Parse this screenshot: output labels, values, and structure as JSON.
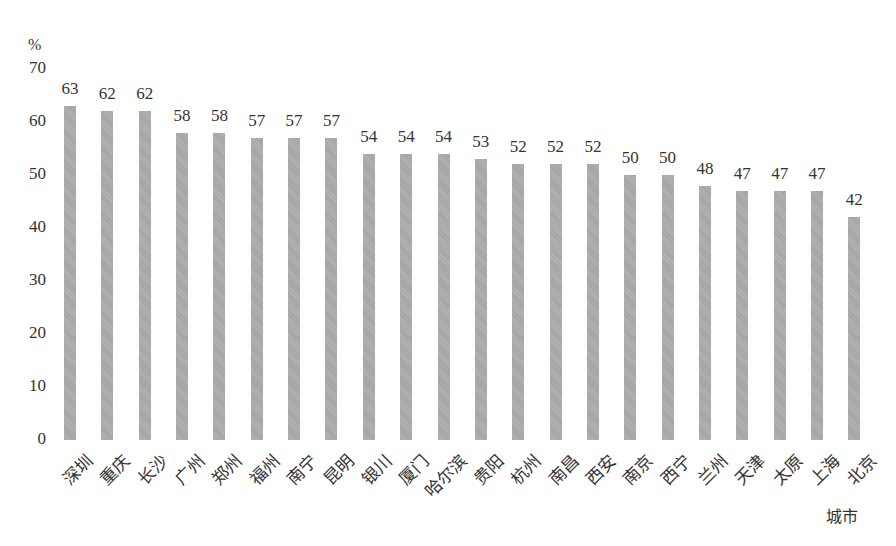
{
  "chart_data": {
    "type": "bar",
    "title": "",
    "xlabel": "城市",
    "ylabel": "%",
    "ylim": [
      0,
      70
    ],
    "yticks": [
      0,
      10,
      20,
      30,
      40,
      50,
      60,
      70
    ],
    "grid": false,
    "legend": null,
    "categories": [
      "深圳",
      "重庆",
      "长沙",
      "广州",
      "郑州",
      "福州",
      "南宁",
      "昆明",
      "银川",
      "厦门",
      "哈尔滨",
      "贵阳",
      "杭州",
      "南昌",
      "西安",
      "南京",
      "西宁",
      "兰州",
      "天津",
      "太原",
      "上海",
      "北京"
    ],
    "values": [
      63,
      62,
      62,
      58,
      58,
      57,
      57,
      57,
      54,
      54,
      54,
      53,
      52,
      52,
      52,
      50,
      50,
      48,
      47,
      47,
      47,
      42
    ],
    "bar_color": "#a9a9a9"
  }
}
